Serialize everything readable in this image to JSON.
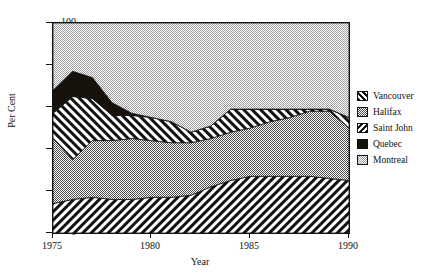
{
  "title": "",
  "axes": {
    "x_title": "Year",
    "y_title": "Per Cent",
    "x_ticks": [
      "1975",
      "1980",
      "1985",
      "1990"
    ],
    "y_ticks": [
      "100",
      "80",
      "60",
      "40",
      "20",
      "0"
    ]
  },
  "legend": {
    "items": [
      {
        "label": "Vancouver",
        "pattern": "diagonal-stripes-right",
        "color": "#1a1a1a"
      },
      {
        "label": "Halifax",
        "pattern": "checker-medium-gray",
        "color": "#8c8c8c"
      },
      {
        "label": "Saint John",
        "pattern": "diagonal-stripes-left",
        "color": "#1a1a1a"
      },
      {
        "label": "Quebec",
        "pattern": "solid-black",
        "color": "#1a140e"
      },
      {
        "label": "Montreal",
        "pattern": "checker-light-gray",
        "color": "#c9c9c9"
      }
    ]
  },
  "chart_data": {
    "type": "area",
    "stacked": true,
    "title": "",
    "xlabel": "Year",
    "ylabel": "Per Cent",
    "xlim": [
      1975,
      1990
    ],
    "ylim": [
      0,
      100
    ],
    "grid": false,
    "legend_position": "right",
    "x": [
      1975,
      1976,
      1977,
      1978,
      1979,
      1980,
      1981,
      1982,
      1983,
      1984,
      1985,
      1986,
      1987,
      1988,
      1989,
      1990
    ],
    "series": [
      {
        "name": "Vancouver",
        "values": [
          14,
          16,
          17,
          16,
          16,
          17,
          17,
          18,
          22,
          25,
          27,
          27,
          27,
          27,
          26,
          25
        ]
      },
      {
        "name": "Halifax",
        "values": [
          31,
          19,
          27,
          28,
          29,
          27,
          26,
          25,
          23,
          23,
          23,
          26,
          28,
          31,
          32,
          25
        ]
      },
      {
        "name": "Saint John",
        "values": [
          12,
          30,
          20,
          12,
          11,
          11,
          10,
          5,
          6,
          11,
          9,
          6,
          4,
          1,
          1,
          5
        ]
      },
      {
        "name": "Quebec",
        "values": [
          11,
          12,
          10,
          6,
          1,
          0,
          0,
          0,
          0,
          0,
          0,
          0,
          0,
          0,
          0,
          0
        ]
      },
      {
        "name": "Montreal",
        "values": [
          32,
          23,
          26,
          38,
          43,
          45,
          47,
          52,
          49,
          41,
          41,
          41,
          41,
          41,
          41,
          45
        ]
      }
    ],
    "cumulative_tops": {
      "Vancouver": [
        14,
        16,
        17,
        16,
        16,
        17,
        17,
        18,
        22,
        25,
        27,
        27,
        27,
        27,
        26,
        25
      ],
      "Halifax": [
        45,
        35,
        44,
        44,
        45,
        44,
        43,
        43,
        45,
        48,
        50,
        53,
        55,
        58,
        58,
        50
      ],
      "Saint John": [
        57,
        65,
        64,
        56,
        56,
        55,
        53,
        48,
        51,
        59,
        59,
        59,
        59,
        59,
        59,
        55
      ],
      "Quebec": [
        68,
        77,
        74,
        62,
        57,
        55,
        53,
        48,
        51,
        59,
        59,
        59,
        59,
        59,
        59,
        55
      ],
      "Montreal": [
        100,
        100,
        100,
        100,
        100,
        100,
        100,
        100,
        100,
        100,
        100,
        100,
        100,
        100,
        100,
        100
      ]
    }
  }
}
